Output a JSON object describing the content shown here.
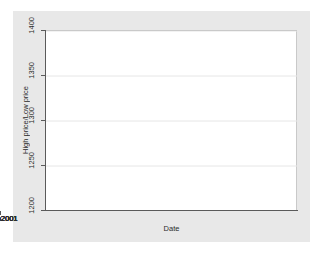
{
  "chart_data": {
    "type": "bar",
    "subtype": "range-capped-vertical",
    "title": "",
    "subtitle": "",
    "xlabel": "Date",
    "ylabel": "High price/Low price",
    "ylim": [
      1200,
      1400
    ],
    "yticks": [
      1200,
      1250,
      1300,
      1350,
      1400
    ],
    "ytick_labels": [
      "1200",
      "1250",
      "1300",
      "1350",
      "1400"
    ],
    "xlim": [
      "28dec2000",
      "03mar2001"
    ],
    "xticks": [
      "01jan2001",
      "15jan2001",
      "29jan2001",
      "12feb2001",
      "26feb2001"
    ],
    "xtick_labels": [
      "01jan2001",
      "15jan2001",
      "29jan2001",
      "12feb2001",
      "26feb2001"
    ],
    "grid": "horizontal",
    "legend": "none",
    "legend_position": "none",
    "series": [
      {
        "name": "High price",
        "role": "upper-cap"
      },
      {
        "name": "Low price",
        "role": "lower-cap"
      }
    ],
    "x": [
      "01jan2001",
      "02jan2001",
      "03jan2001",
      "04jan2001",
      "08jan2001",
      "09jan2001",
      "10jan2001",
      "11jan2001",
      "12jan2001",
      "15jan2001",
      "16jan2001",
      "17jan2001",
      "18jan2001",
      "19jan2001",
      "22jan2001",
      "23jan2001",
      "24jan2001",
      "25jan2001",
      "26jan2001",
      "29jan2001",
      "30jan2001",
      "31jan2001",
      "01feb2001",
      "02feb2001",
      "05feb2001",
      "06feb2001",
      "07feb2001",
      "08feb2001",
      "09feb2001",
      "12feb2001",
      "13feb2001",
      "14feb2001",
      "15feb2001",
      "16feb2001",
      "20feb2001",
      "21feb2001",
      "22feb2001",
      "23feb2001",
      "26feb2001"
    ],
    "high": [
      1320,
      1302,
      1348,
      1334,
      1302,
      1306,
      1318,
      1324,
      1324,
      1326,
      1333,
      1341,
      1346,
      1352,
      1348,
      1353,
      1361,
      1358,
      1353,
      1357,
      1368,
      1377,
      1371,
      1369,
      1358,
      1353,
      1343,
      1341,
      1332,
      1320,
      1328,
      1319,
      1324,
      1326,
      1313,
      1290,
      1266,
      1256,
      1251
    ],
    "low": [
      1277,
      1276,
      1326,
      1296,
      1278,
      1288,
      1300,
      1310,
      1310,
      1314,
      1322,
      1326,
      1338,
      1341,
      1336,
      1344,
      1352,
      1348,
      1343,
      1350,
      1357,
      1366,
      1360,
      1350,
      1344,
      1340,
      1330,
      1328,
      1309,
      1308,
      1317,
      1305,
      1312,
      1293,
      1278,
      1253,
      1245,
      1227,
      1213
    ]
  },
  "axes": {
    "y_title": "High price/Low price",
    "x_title": "Date"
  },
  "style": {
    "graph_background": "#e8e8e8",
    "plot_background": "#ffffff",
    "axis_color": "#5a5a5a",
    "grid_color": "#e6e6e6",
    "marker_color": "#8d8d8d",
    "text_color": "#2b2b2b"
  }
}
